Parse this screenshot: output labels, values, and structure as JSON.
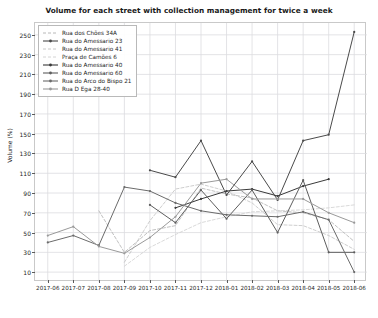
{
  "chart_data": {
    "type": "line",
    "title": "Volume for each street with collection management for twice a week",
    "xlabel": "",
    "ylabel": "Volume (%)",
    "categories": [
      "2017-06",
      "2017-07",
      "2017-08",
      "2017-09",
      "2017-10",
      "2017-11",
      "2017-12",
      "2018-01",
      "2018-02",
      "2018-03",
      "2018-04",
      "2018-05",
      "2018-06"
    ],
    "ylim": [
      0,
      262
    ],
    "yticks": [
      10,
      30,
      50,
      70,
      90,
      110,
      130,
      150,
      170,
      190,
      210,
      230,
      250
    ],
    "grid": true,
    "legend_position": "upper left",
    "series": [
      {
        "name": "Rua dos Chões 34A",
        "color": "#b0b0b0",
        "linestyle": "dashed",
        "marker": "none",
        "values": [
          null,
          null,
          72,
          30,
          52,
          57,
          95,
          89,
          85,
          72,
          70,
          63,
          41
        ]
      },
      {
        "name": "Rua do Amessario 23",
        "color": "#4a4a4a",
        "linestyle": "solid",
        "marker": "dot",
        "values": [
          null,
          null,
          null,
          null,
          113,
          106,
          143,
          88,
          122,
          83,
          143,
          149,
          253
        ]
      },
      {
        "name": "Rua do Amessario 41",
        "color": "#c2c2c2",
        "linestyle": "dashed",
        "marker": "none",
        "values": [
          null,
          null,
          null,
          20,
          62,
          94,
          99,
          92,
          80,
          58,
          57,
          47,
          33
        ]
      },
      {
        "name": "Praça de Camões 6",
        "color": "#cfcfcf",
        "linestyle": "dashed",
        "marker": "none",
        "values": [
          null,
          null,
          null,
          16,
          35,
          48,
          60,
          66,
          71,
          72,
          73,
          75,
          78
        ]
      },
      {
        "name": "Rua do Amessario 40",
        "color": "#3a3a3a",
        "linestyle": "solid",
        "marker": "dot",
        "values": [
          null,
          null,
          null,
          null,
          null,
          75,
          84,
          92,
          94,
          87,
          97,
          104,
          null
        ]
      },
      {
        "name": "Rua do Amessario 60",
        "color": "#5e5e5e",
        "linestyle": "solid",
        "marker": "dot",
        "values": [
          null,
          null,
          null,
          null,
          78,
          60,
          93,
          64,
          93,
          50,
          103,
          30,
          30
        ]
      },
      {
        "name": "Rua do Arco do Bispo 21",
        "color": "#6b6b6b",
        "linestyle": "solid",
        "marker": "dot",
        "values": [
          40,
          47,
          37,
          96,
          92,
          80,
          72,
          68,
          67,
          66,
          71,
          63,
          10
        ]
      },
      {
        "name": "Rua D Ega 28-40",
        "color": "#9a9a9a",
        "linestyle": "solid",
        "marker": "dot",
        "values": [
          47,
          56,
          36,
          29,
          45,
          66,
          100,
          104,
          84,
          84,
          84,
          70,
          60
        ]
      }
    ]
  }
}
